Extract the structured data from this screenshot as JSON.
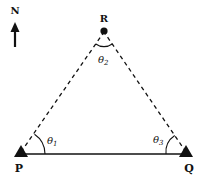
{
  "diagram": {
    "type": "triangulation-survey",
    "compass": {
      "label": "N",
      "direction": "up"
    },
    "points": {
      "P": {
        "label": "P",
        "marker": "triangle"
      },
      "Q": {
        "label": "Q",
        "marker": "triangle"
      },
      "R": {
        "label": "R",
        "marker": "dot"
      }
    },
    "angles": {
      "theta1": {
        "label": "θ",
        "sub": "1",
        "vertex": "P"
      },
      "theta2": {
        "label": "θ",
        "sub": "2",
        "vertex": "R"
      },
      "theta3": {
        "label": "θ",
        "sub": "3",
        "vertex": "Q"
      }
    },
    "edges": [
      {
        "from": "P",
        "to": "Q",
        "style": "solid"
      },
      {
        "from": "P",
        "to": "R",
        "style": "dashed"
      },
      {
        "from": "Q",
        "to": "R",
        "style": "dashed"
      }
    ],
    "colors": {
      "ink": "#111111",
      "background": "#ffffff"
    }
  }
}
